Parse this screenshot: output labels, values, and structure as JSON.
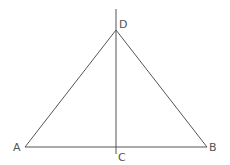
{
  "diagram": {
    "type": "geometry",
    "points": {
      "A": {
        "label": "A",
        "x": 25,
        "y": 147
      },
      "B": {
        "label": "B",
        "x": 207,
        "y": 147
      },
      "C": {
        "label": "C",
        "x": 116,
        "y": 147
      },
      "D": {
        "label": "D",
        "x": 116,
        "y": 30
      }
    },
    "segments": [
      [
        "A",
        "B"
      ],
      [
        "A",
        "D"
      ],
      [
        "B",
        "D"
      ]
    ],
    "lines": [
      {
        "through": [
          "D",
          "C"
        ],
        "extends": true
      }
    ],
    "colors": {
      "stroke": "#555555",
      "label": "#555555"
    }
  }
}
